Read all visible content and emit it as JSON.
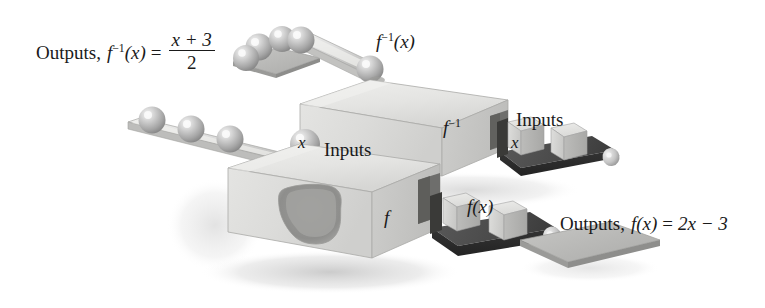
{
  "figure": {
    "background_color": "#ffffff"
  },
  "labels": {
    "outputs_inverse_prefix": "Outputs,",
    "outputs_inverse_fn": "f",
    "outputs_inverse_exp": "−1",
    "outputs_inverse_arg": "(x)",
    "outputs_inverse_equals": "=",
    "outputs_inverse_numerator": "x + 3",
    "outputs_inverse_denominator": "2",
    "outputs_f_prefix": "Outputs,",
    "outputs_f_fn": "f",
    "outputs_f_arg": "(x)",
    "outputs_f_equals": "=",
    "outputs_f_rhs": "2x − 3",
    "inputs_upper": "Inputs",
    "inputs_lower": "Inputs",
    "finv_chute_fn": "f",
    "finv_chute_exp": "−1",
    "finv_chute_arg": "(x)",
    "finv_box_fn": "f",
    "finv_box_exp": "−1",
    "f_box_fn": "f",
    "fx_conveyor_fn": "f",
    "fx_conveyor_arg": "(x)",
    "x_sphere": "x",
    "x_cube": "x"
  },
  "colors": {
    "text": "#1a1a1a",
    "page_background": "#ffffff",
    "box_top_face": "#e6e6e4",
    "box_front_face": "#dcdcda",
    "box_side_face": "#c9c9c7",
    "box_outline": "#9a9a98",
    "hole_dark": "#8f8f8d",
    "conveyor_dark": "#4c4c4c",
    "conveyor_side": "#2e2e2e",
    "cube_light": "#d8d8d6",
    "cube_shade": "#b4b4b2",
    "sphere_light": "#dedede",
    "sphere_mid": "#a8a8a8",
    "sphere_dark": "#808080",
    "plate_gray": "#b9b9b7",
    "chute_light": "#e2e2e0",
    "shadow": "#cfcfcf"
  },
  "objects": {
    "upper_machine": {
      "name": "f-inverse machine box",
      "face_label": "f−1"
    },
    "lower_machine": {
      "name": "f machine box",
      "face_label": "f"
    },
    "upper_input_conveyor": {
      "name": "inputs conveyor for f-inverse",
      "items": [
        "x",
        ""
      ]
    },
    "lower_output_conveyor": {
      "name": "outputs conveyor for f",
      "items": [
        "",
        ""
      ]
    },
    "lower_input_ramp": {
      "name": "inputs sphere ramp for f",
      "sphere_count": 4,
      "labeled_sphere": "x"
    },
    "upper_output_chute": {
      "name": "outputs sphere chute for f-inverse",
      "sphere_count": 5
    }
  }
}
